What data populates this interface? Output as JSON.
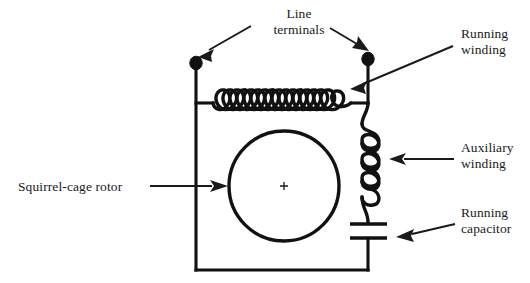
{
  "figure": {
    "background_color": "#ffffff",
    "line_color": "#111111",
    "text_color": "#1a1a1a"
  },
  "labels": {
    "line_terminals": {
      "line1": "Line",
      "line2": "terminals"
    },
    "running_winding": {
      "line1": "Running",
      "line2": "winding"
    },
    "auxiliary_winding": {
      "line1": "Auxiliary",
      "line2": "winding"
    },
    "running_capacitor": {
      "line1": "Running",
      "line2": "capacitor"
    },
    "squirrel_cage_rotor": {
      "line1": "Squirrel-cage rotor"
    }
  },
  "components": {
    "rotor": {
      "name": "squirrel-cage rotor",
      "shape": "circle",
      "center_x": 284,
      "center_y": 186,
      "radius": 55,
      "center_mark": "+"
    },
    "running_winding": {
      "name": "running winding",
      "orientation": "horizontal",
      "loops": 6
    },
    "auxiliary_winding": {
      "name": "auxiliary winding",
      "orientation": "vertical",
      "loops": 4
    },
    "running_capacitor": {
      "name": "running capacitor",
      "plates": 2
    },
    "terminals": [
      {
        "name": "left line terminal",
        "x": 196,
        "y": 64
      },
      {
        "name": "right line terminal",
        "x": 368,
        "y": 60
      }
    ],
    "frame": {
      "name": "motor frame",
      "left_x": 196,
      "right_x": 368,
      "bottom_y": 270,
      "winding_y": 103
    }
  },
  "annotations": [
    {
      "target": "left line terminal",
      "arrow": "down-left"
    },
    {
      "target": "right line terminal",
      "arrow": "down-right"
    },
    {
      "target": "running winding",
      "arrow": "down-left"
    },
    {
      "target": "auxiliary winding",
      "arrow": "left"
    },
    {
      "target": "running capacitor",
      "arrow": "left"
    },
    {
      "target": "squirrel-cage rotor",
      "arrow": "right"
    }
  ]
}
